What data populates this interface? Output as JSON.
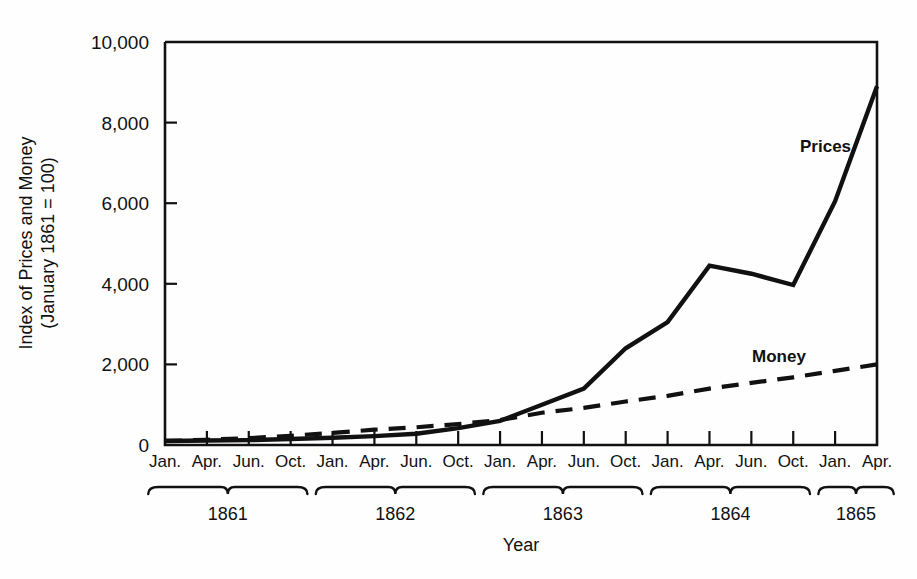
{
  "chart_data": {
    "type": "line",
    "title": "",
    "xlabel": "Year",
    "ylabel_line1": "Index of Prices and Money",
    "ylabel_line2": "(January 1861 = 100)",
    "grid": false,
    "legend_position": "inline-annotations",
    "ylim": [
      0,
      10000
    ],
    "yticks": [
      0,
      2000,
      4000,
      6000,
      8000,
      10000
    ],
    "ytick_labels": [
      "0",
      "2,000",
      "4,000",
      "6,000",
      "8,000",
      "10,000"
    ],
    "xtick_labels": [
      "Jan.",
      "Apr.",
      "Jun.",
      "Oct.",
      "Jan.",
      "Apr.",
      "Jun.",
      "Oct.",
      "Jan.",
      "Apr.",
      "Jun.",
      "Oct.",
      "Jan.",
      "Apr.",
      "Jun.",
      "Oct.",
      "Jan.",
      "Apr."
    ],
    "x": [
      "1861-Jan",
      "1861-Apr",
      "1861-Jun",
      "1861-Oct",
      "1862-Jan",
      "1862-Apr",
      "1862-Jun",
      "1862-Oct",
      "1863-Jan",
      "1863-Apr",
      "1863-Jun",
      "1863-Oct",
      "1864-Jan",
      "1864-Apr",
      "1864-Jun",
      "1864-Oct",
      "1865-Jan",
      "1865-Apr"
    ],
    "year_groups": [
      {
        "label": "1861",
        "ticks": 4
      },
      {
        "label": "1862",
        "ticks": 4
      },
      {
        "label": "1863",
        "ticks": 4
      },
      {
        "label": "1864",
        "ticks": 4
      },
      {
        "label": "1865",
        "ticks": 2
      }
    ],
    "series": [
      {
        "name": "Prices",
        "style": "solid",
        "label": "Prices",
        "values": [
          100,
          110,
          120,
          150,
          180,
          220,
          280,
          420,
          600,
          1000,
          1400,
          2400,
          3050,
          4450,
          4250,
          3970,
          6050,
          8900
        ]
      },
      {
        "name": "Money",
        "style": "dashed",
        "label": "Money",
        "values": [
          100,
          130,
          170,
          230,
          300,
          380,
          440,
          520,
          620,
          800,
          920,
          1080,
          1220,
          1400,
          1540,
          1680,
          1840,
          2000
        ]
      }
    ],
    "colors": {
      "ink": "#111111",
      "background": "#fefefe"
    }
  }
}
